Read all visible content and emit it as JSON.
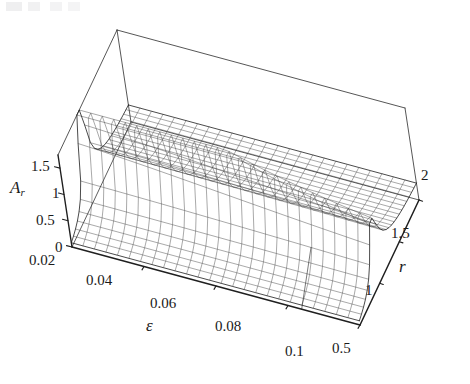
{
  "figure": {
    "kind": "3d-surface-wireframe",
    "background_color": "#ffffff",
    "line_color": "#1f1f1f",
    "mesh_color": "#3a3a3a",
    "width": 470,
    "height": 384
  },
  "axes": {
    "x": {
      "name": "epsilon-axis",
      "label": "ε",
      "min": 0.02,
      "max": 0.1,
      "ticks": [
        0.02,
        0.04,
        0.06,
        0.08,
        0.1
      ],
      "tick_labels": [
        "0.02",
        "0.04",
        "0.06",
        "0.08",
        "0.1"
      ]
    },
    "y": {
      "name": "r-axis",
      "label": "r",
      "min": 0.5,
      "max": 2,
      "ticks": [
        0.5,
        1,
        1.5,
        2
      ],
      "tick_labels": [
        "0.5",
        "1",
        "1.5",
        "2"
      ]
    },
    "z": {
      "name": "amplitude-axis",
      "label_base": "A",
      "label_sub": "r",
      "min": 0,
      "max": 1.75,
      "ticks": [
        0,
        0.5,
        1,
        1.5
      ],
      "tick_labels": [
        "0",
        "0.5",
        "1",
        "1.5"
      ]
    }
  },
  "tick_label_positions": {
    "z": [
      {
        "text": "1.5",
        "left": 31,
        "top": 159
      },
      {
        "text": "1",
        "left": 52,
        "top": 186
      },
      {
        "text": "0.5",
        "left": 36,
        "top": 213
      },
      {
        "text": "0",
        "left": 55,
        "top": 240
      }
    ],
    "x": [
      {
        "text": "0.02",
        "left": 29,
        "top": 253
      },
      {
        "text": "0.04",
        "left": 86,
        "top": 273
      },
      {
        "text": "0.06",
        "left": 150,
        "top": 296
      },
      {
        "text": "0.08",
        "left": 215,
        "top": 319
      },
      {
        "text": "0.1",
        "left": 285,
        "top": 344
      }
    ],
    "y": [
      {
        "text": "0.5",
        "left": 332,
        "top": 341
      },
      {
        "text": "1",
        "left": 365,
        "top": 283
      },
      {
        "text": "1.5",
        "left": 391,
        "top": 226
      },
      {
        "text": "2",
        "left": 421,
        "top": 168
      }
    ]
  },
  "axis_title_positions": {
    "z": {
      "left": 10,
      "top": 179
    },
    "x": {
      "left": 146,
      "top": 317
    },
    "y": {
      "left": 399,
      "top": 258
    }
  },
  "chart_data": {
    "type": "surface",
    "title": "",
    "xlabel": "ε",
    "ylabel": "r",
    "zlabel": "A_r",
    "xlim": [
      0.02,
      0.1
    ],
    "ylim": [
      0.5,
      2.0
    ],
    "zlim": [
      0,
      1.75
    ],
    "grid": false,
    "legend": "none",
    "mesh": {
      "nx": 25,
      "ny": 25
    },
    "x": [
      0.02,
      0.03,
      0.04,
      0.05,
      0.06,
      0.07,
      0.08,
      0.09,
      0.1
    ],
    "y": [
      0.5,
      0.6875,
      0.875,
      1.0625,
      1.25,
      1.4375,
      1.625,
      1.8125,
      2.0
    ],
    "z": [
      [
        0.02,
        0.03,
        0.05,
        0.08,
        0.14,
        0.26,
        0.55,
        1.05,
        1.75
      ],
      [
        0.02,
        0.03,
        0.05,
        0.08,
        0.13,
        0.23,
        0.44,
        0.78,
        1.22
      ],
      [
        0.02,
        0.03,
        0.04,
        0.07,
        0.12,
        0.2,
        0.36,
        0.6,
        0.9
      ],
      [
        0.02,
        0.03,
        0.04,
        0.07,
        0.11,
        0.18,
        0.3,
        0.48,
        0.71
      ],
      [
        0.02,
        0.02,
        0.04,
        0.06,
        0.1,
        0.16,
        0.26,
        0.4,
        0.58
      ],
      [
        0.02,
        0.02,
        0.04,
        0.06,
        0.09,
        0.14,
        0.22,
        0.34,
        0.49
      ],
      [
        0.02,
        0.02,
        0.03,
        0.05,
        0.08,
        0.13,
        0.2,
        0.3,
        0.42
      ],
      [
        0.01,
        0.02,
        0.03,
        0.05,
        0.08,
        0.12,
        0.18,
        0.26,
        0.37
      ],
      [
        0.01,
        0.02,
        0.03,
        0.05,
        0.07,
        0.11,
        0.16,
        0.23,
        0.33
      ]
    ],
    "peak": {
      "x": 0.02,
      "y": 2.0,
      "z": 1.75
    },
    "surface_formula_hint": "A_r = r^2 / sqrt((1-r^2)^2 + (2*eps*r)^2)"
  },
  "projection": {
    "note": "image-space pixel anchors of the plot bounding box corners used to build the axonometric transform",
    "base_front_left": [
      72,
      247
    ],
    "base_front_right": [
      360,
      325
    ],
    "base_back_right": [
      428,
      172
    ],
    "base_back_left": [
      131,
      122
    ],
    "top_front_left": [
      58,
      155
    ],
    "apex": [
      213,
      17
    ]
  }
}
